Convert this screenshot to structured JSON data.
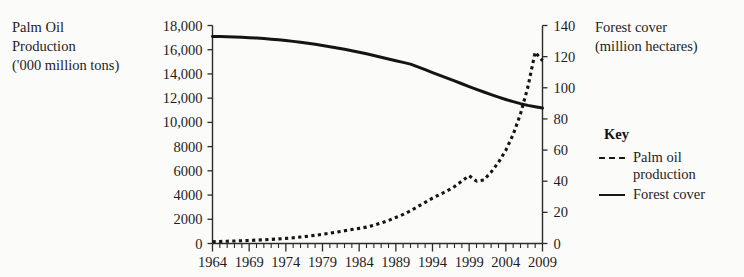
{
  "chart_data": {
    "type": "line",
    "title": "",
    "xlabel": "",
    "ylabel": "Palm Oil Production ('000 million tons)",
    "y2label": "Forest cover (million hectares)",
    "grid": false,
    "legend_position": "right",
    "xlim": [
      1964,
      2009
    ],
    "ylim": [
      0,
      18000
    ],
    "y2lim": [
      0,
      140
    ],
    "x_tick_labels": [
      "1964",
      "1969",
      "1974",
      "1979",
      "1984",
      "1989",
      "1994",
      "1999",
      "2004",
      "2009"
    ],
    "x_tick_values": [
      1964,
      1969,
      1974,
      1979,
      1984,
      1989,
      1994,
      1999,
      2004,
      2009
    ],
    "x_minor_tick_step": 1,
    "y_tick_labels": [
      "0",
      "2000",
      "4000",
      "6000",
      "8000",
      "10,000",
      "12,000",
      "14,000",
      "16,000",
      "18,000"
    ],
    "y_tick_values": [
      0,
      2000,
      4000,
      6000,
      8000,
      10000,
      12000,
      14000,
      16000,
      18000
    ],
    "y2_tick_labels": [
      "0",
      "20",
      "40",
      "60",
      "80",
      "100",
      "120",
      "140"
    ],
    "y2_tick_values": [
      0,
      20,
      40,
      60,
      80,
      100,
      120,
      140
    ],
    "x": [
      1964,
      1965,
      1966,
      1967,
      1968,
      1969,
      1970,
      1971,
      1972,
      1973,
      1974,
      1975,
      1976,
      1977,
      1978,
      1979,
      1980,
      1981,
      1982,
      1983,
      1984,
      1985,
      1986,
      1987,
      1988,
      1989,
      1990,
      1991,
      1992,
      1993,
      1994,
      1995,
      1996,
      1997,
      1998,
      1999,
      2000,
      2001,
      2002,
      2003,
      2004,
      2005,
      2006,
      2007,
      2008,
      2009
    ],
    "series": [
      {
        "name": "Palm oil production",
        "axis": "left",
        "style": "dotted",
        "units": "'000 million tons",
        "values": [
          150,
          170,
          190,
          210,
          230,
          250,
          280,
          310,
          340,
          380,
          420,
          470,
          530,
          600,
          680,
          760,
          850,
          950,
          1050,
          1150,
          1250,
          1350,
          1500,
          1700,
          1900,
          2150,
          2400,
          2700,
          3050,
          3400,
          3750,
          4050,
          4350,
          4700,
          5150,
          5600,
          5150,
          5250,
          5900,
          6700,
          7700,
          9000,
          10700,
          12900,
          15800,
          15100
        ]
      },
      {
        "name": "Forest cover",
        "axis": "right",
        "style": "solid",
        "units": "million hectares",
        "values": [
          133.0,
          132.9,
          132.8,
          132.6,
          132.4,
          132.2,
          131.9,
          131.6,
          131.2,
          130.8,
          130.3,
          129.8,
          129.2,
          128.6,
          127.9,
          127.2,
          126.4,
          125.6,
          124.7,
          123.8,
          122.8,
          121.8,
          120.7,
          119.6,
          118.5,
          117.4,
          116.3,
          115.2,
          113.4,
          111.6,
          109.8,
          108.0,
          106.2,
          104.4,
          102.6,
          100.8,
          99.0,
          97.3,
          95.6,
          94.0,
          92.5,
          91.1,
          89.8,
          88.7,
          87.8,
          87.0
        ]
      }
    ]
  },
  "labels": {
    "left_axis_title_lines": [
      "Palm Oil",
      "Production",
      "('000 million tons)"
    ],
    "right_axis_title_lines": [
      "Forest cover",
      "(million hectares)"
    ]
  },
  "legend": {
    "title": "Key",
    "items": [
      {
        "style": "dotted",
        "label_lines": [
          "Palm oil",
          "production"
        ]
      },
      {
        "style": "solid",
        "label_lines": [
          "Forest cover"
        ]
      }
    ]
  },
  "colors": {
    "ink": "#141414",
    "background": "#fbfbfa",
    "axis": "#2b2b2b"
  }
}
